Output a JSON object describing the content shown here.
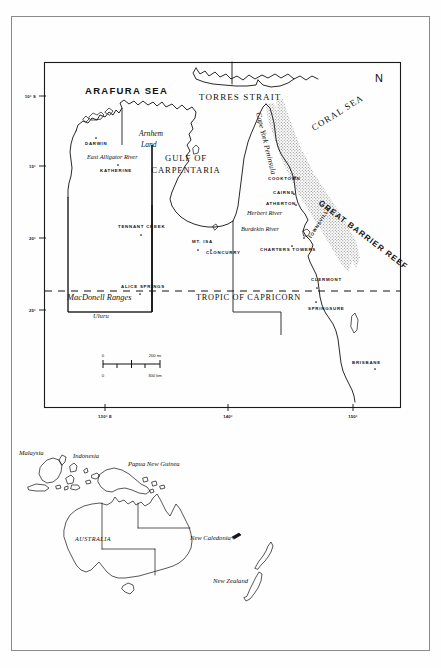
{
  "document": {
    "type": "map-figure",
    "title": "Northern Australia and Queensland reference map",
    "compass": "N"
  },
  "main_map": {
    "seas": [
      {
        "name": "arafura-sea",
        "label": "ARAFURA SEA"
      },
      {
        "name": "torres-strait",
        "label": "TORRES STRAIT"
      },
      {
        "name": "coral-sea",
        "label": "CORAL SEA"
      },
      {
        "name": "gulf-of-carpentaria",
        "label_line1": "GULF OF",
        "label_line2": "CARPENTARIA"
      }
    ],
    "regions": [
      {
        "name": "arnhem-land",
        "label_line1": "Arnhem",
        "label_line2": "Land"
      },
      {
        "name": "cape-york-peninsula",
        "label": "Cape York Peninsula"
      },
      {
        "name": "great-barrier-reef",
        "label": "GREAT BARRIER REEF"
      },
      {
        "name": "macdonnell-ranges",
        "label": "MacDonell Ranges"
      }
    ],
    "rivers": [
      {
        "name": "east-alligator-river",
        "label": "East Alligator River"
      },
      {
        "name": "herbert-river",
        "label": "Herbert River"
      },
      {
        "name": "burdekin-river",
        "label": "Burdekin River"
      }
    ],
    "places": [
      {
        "name": "darwin",
        "label": "DARWIN"
      },
      {
        "name": "katherine",
        "label": "KATHERINE"
      },
      {
        "name": "tennant-creek",
        "label": "TENNANT CREEK"
      },
      {
        "name": "alice-springs",
        "label": "ALICE SPRINGS"
      },
      {
        "name": "uluru",
        "label": "Uluru"
      },
      {
        "name": "mount-isa",
        "label": "MT. ISA"
      },
      {
        "name": "cloncurry",
        "label": "CLONCURRY"
      },
      {
        "name": "cooktown",
        "label": "COOKTOWN"
      },
      {
        "name": "cairns",
        "label": "CAIRNS"
      },
      {
        "name": "atherton",
        "label": "ATHERTON"
      },
      {
        "name": "townsville",
        "label": "TOWNSVILLE"
      },
      {
        "name": "charters-towers",
        "label": "CHARTERS TOWERS"
      },
      {
        "name": "clermont",
        "label": "CLERMONT"
      },
      {
        "name": "springsure",
        "label": "SPRINGSURE"
      },
      {
        "name": "brisbane",
        "label": "BRISBANE"
      }
    ],
    "graticule": {
      "tropic_label": "TROPIC OF CAPRICORN",
      "latitudes": [
        "10° S",
        "15°",
        "20°",
        "25°"
      ],
      "longitudes": [
        "130° E",
        "140°",
        "150°"
      ]
    },
    "scale": {
      "miles_zero": "0",
      "miles_max": "200 mi",
      "km_zero": "0",
      "km_max": "300 km"
    }
  },
  "inset_map": {
    "labels": [
      {
        "name": "malaysia",
        "label": "Malaysia"
      },
      {
        "name": "indonesia",
        "label": "Indonesia"
      },
      {
        "name": "papua-new-guinea",
        "label": "Papua New Guinea"
      },
      {
        "name": "australia",
        "label": "AUSTRALIA"
      },
      {
        "name": "new-caledonia",
        "label": "New Caledonia"
      },
      {
        "name": "new-zealand",
        "label": "New Zealand"
      }
    ]
  },
  "colors": {
    "ink": "#111111",
    "page_border": "#8a8a8a",
    "reef_stipple": "#7a7a7a",
    "background": "#fefefe"
  }
}
